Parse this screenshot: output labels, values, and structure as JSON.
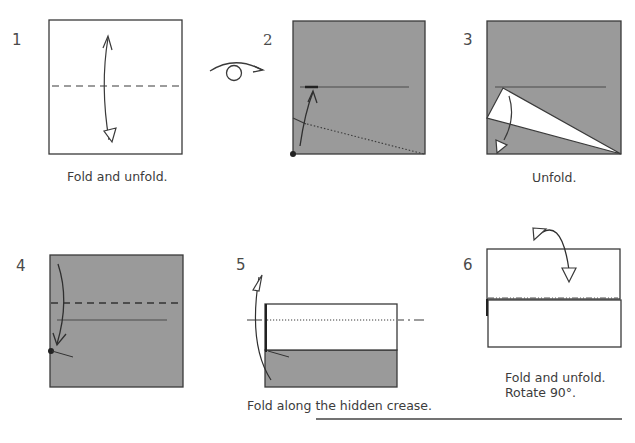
{
  "steps": [
    {
      "number": "1",
      "caption": "Fold and unfold."
    },
    {
      "number": "2",
      "caption": ""
    },
    {
      "number": "3",
      "caption": "Unfold."
    },
    {
      "number": "4",
      "caption": ""
    },
    {
      "number": "5",
      "caption": "Fold along the hidden crease."
    },
    {
      "number": "6",
      "caption": "Fold and unfold.",
      "caption_line2": "Rotate 90°."
    }
  ],
  "symbols": {
    "turn_over": "turn-over-icon",
    "valley_fold": "valley-fold-line",
    "mountain_fold": "mountain-fold-line",
    "existing_crease": "crease-line"
  },
  "colors": {
    "paper_colored": "#9a9a9a",
    "paper_white": "#ffffff",
    "line": "#3a3a3a",
    "text": "#3c3c3c"
  }
}
